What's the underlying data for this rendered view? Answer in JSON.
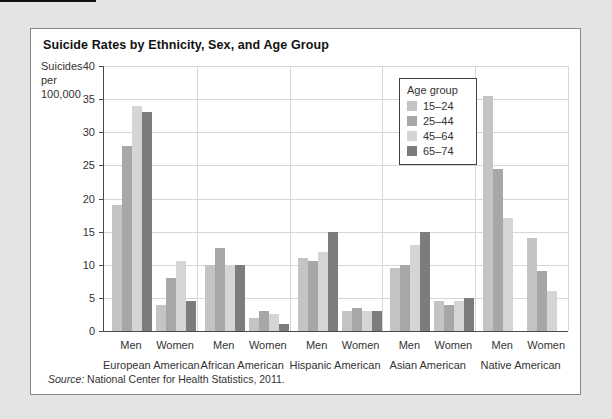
{
  "page": {
    "background_color": "#e4e4e2"
  },
  "figure": {
    "title": "Suicide Rates by Ethnicity, Sex, and Age Group",
    "y_axis_label_lines": [
      "Suicides",
      "per",
      "100,000"
    ],
    "source_label": "Source:",
    "source_text": " National Center for Health Statistics, 2011."
  },
  "chart_data": {
    "type": "bar",
    "title": "Suicide Rates by Ethnicity, Sex, and Age Group",
    "ylabel": "Suicides per 100,000",
    "xlabel": "",
    "ylim": [
      0,
      40
    ],
    "yticks": [
      0,
      5,
      10,
      15,
      20,
      25,
      30,
      35,
      40
    ],
    "grid": true,
    "legend_title": "Age group",
    "legend_position": "upper-middle-right-inside",
    "age_groups": [
      {
        "label": "15–24",
        "color": "#c4c5c3"
      },
      {
        "label": "25–44",
        "color": "#a7a8a6"
      },
      {
        "label": "45–64",
        "color": "#d5d6d4"
      },
      {
        "label": "65–74",
        "color": "#7c7d7b"
      }
    ],
    "groups": [
      {
        "ethnicity": "European American",
        "clusters": [
          {
            "sex": "Men",
            "values": [
              19,
              28,
              34,
              33
            ]
          },
          {
            "sex": "Women",
            "values": [
              4,
              8,
              10.5,
              4.5
            ]
          }
        ]
      },
      {
        "ethnicity": "African American",
        "clusters": [
          {
            "sex": "Men",
            "values": [
              10,
              12.5,
              10,
              10
            ]
          },
          {
            "sex": "Women",
            "values": [
              2,
              3,
              2.5,
              1
            ]
          }
        ]
      },
      {
        "ethnicity": "Hispanic American",
        "clusters": [
          {
            "sex": "Men",
            "values": [
              11,
              10.5,
              12,
              15
            ]
          },
          {
            "sex": "Women",
            "values": [
              3,
              3.5,
              3,
              3
            ]
          }
        ]
      },
      {
        "ethnicity": "Asian American",
        "clusters": [
          {
            "sex": "Men",
            "values": [
              9.5,
              10,
              13,
              15
            ]
          },
          {
            "sex": "Women",
            "values": [
              4.5,
              4,
              4.5,
              5
            ]
          }
        ]
      },
      {
        "ethnicity": "Native American",
        "clusters": [
          {
            "sex": "Men",
            "values": [
              35.5,
              24.5,
              17,
              null
            ]
          },
          {
            "sex": "Women",
            "values": [
              14,
              9,
              6,
              null
            ]
          }
        ]
      }
    ],
    "source": "Source: National Center for Health Statistics, 2011."
  }
}
